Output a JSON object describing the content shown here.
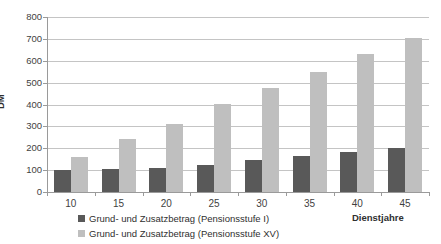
{
  "top_clipped_text": "",
  "chart_data": {
    "type": "bar",
    "title": "",
    "xlabel": "Dienstjahre",
    "ylabel": "DM",
    "categories": [
      "10",
      "15",
      "20",
      "25",
      "30",
      "35",
      "40",
      "45"
    ],
    "ylim": [
      0,
      800
    ],
    "ytick_step": 100,
    "yticks": [
      "800",
      "700",
      "600",
      "500",
      "400",
      "300",
      "200",
      "100",
      "0"
    ],
    "grid": true,
    "legend_position": "bottom-left",
    "series": [
      {
        "name": "Grund- und Zusatzbetrag (Pensionsstufe I)",
        "color": "#595959",
        "values": [
          100,
          105,
          110,
          125,
          148,
          165,
          185,
          202
        ]
      },
      {
        "name": "Grund- und Zusatzbetrag (Pensionsstufe XV)",
        "color": "#bfbfbf",
        "values": [
          160,
          240,
          310,
          400,
          475,
          550,
          630,
          705
        ]
      }
    ]
  },
  "colors": {
    "series_dark": "#595959",
    "series_light": "#bfbfbf",
    "gridline": "#c4c4c4",
    "axis": "#9a9a9a",
    "text": "#3f3f3f"
  }
}
